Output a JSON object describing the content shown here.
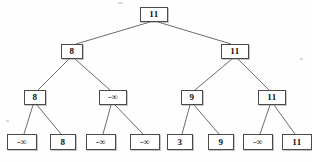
{
  "diagram": {
    "type": "binary-tree",
    "title": "",
    "depth": 4,
    "node_count": 15,
    "colors": {
      "background": "#fefefe",
      "node_fill": "#ffffff",
      "node_border": "#4a4a4a",
      "edge": "#5a5a5a",
      "text": "#111111"
    },
    "nodes": [
      {
        "id": "n1",
        "level": 1,
        "label": "11",
        "x": 154,
        "y": 14
      },
      {
        "id": "n2",
        "level": 2,
        "label": "8",
        "x": 72,
        "y": 51
      },
      {
        "id": "n3",
        "level": 2,
        "label": "11",
        "x": 235,
        "y": 51
      },
      {
        "id": "n4",
        "level": 3,
        "label": "8",
        "x": 35,
        "y": 97
      },
      {
        "id": "n5",
        "level": 3,
        "label": "-∞",
        "x": 113,
        "y": 97
      },
      {
        "id": "n6",
        "level": 3,
        "label": "9",
        "x": 192,
        "y": 97
      },
      {
        "id": "n7",
        "level": 3,
        "label": "11",
        "x": 272,
        "y": 97
      },
      {
        "id": "n8",
        "level": 4,
        "label": "-∞",
        "x": 22,
        "y": 142
      },
      {
        "id": "n9",
        "level": 4,
        "label": "8",
        "x": 63,
        "y": 142
      },
      {
        "id": "n10",
        "level": 4,
        "label": "-∞",
        "x": 101,
        "y": 142
      },
      {
        "id": "n11",
        "level": 4,
        "label": "-∞",
        "x": 145,
        "y": 142
      },
      {
        "id": "n12",
        "level": 4,
        "label": "3",
        "x": 180,
        "y": 142
      },
      {
        "id": "n13",
        "level": 4,
        "label": "9",
        "x": 221,
        "y": 142
      },
      {
        "id": "n14",
        "level": 4,
        "label": "-∞",
        "x": 258,
        "y": 142
      },
      {
        "id": "n15",
        "level": 4,
        "label": "11",
        "x": 297,
        "y": 142
      }
    ],
    "edges": [
      {
        "from": "n1",
        "to": "n2",
        "x1": 150,
        "y1": 22,
        "x2": 76,
        "y2": 44
      },
      {
        "from": "n1",
        "to": "n3",
        "x1": 158,
        "y1": 22,
        "x2": 231,
        "y2": 44
      },
      {
        "from": "n2",
        "to": "n4",
        "x1": 69,
        "y1": 59,
        "x2": 38,
        "y2": 90
      },
      {
        "from": "n2",
        "to": "n5",
        "x1": 75,
        "y1": 59,
        "x2": 110,
        "y2": 90
      },
      {
        "from": "n3",
        "to": "n6",
        "x1": 232,
        "y1": 59,
        "x2": 195,
        "y2": 90
      },
      {
        "from": "n3",
        "to": "n7",
        "x1": 238,
        "y1": 59,
        "x2": 269,
        "y2": 90
      },
      {
        "from": "n4",
        "to": "n8",
        "x1": 33,
        "y1": 105,
        "x2": 24,
        "y2": 134
      },
      {
        "from": "n4",
        "to": "n9",
        "x1": 37,
        "y1": 105,
        "x2": 61,
        "y2": 134
      },
      {
        "from": "n5",
        "to": "n10",
        "x1": 111,
        "y1": 105,
        "x2": 103,
        "y2": 134
      },
      {
        "from": "n5",
        "to": "n11",
        "x1": 115,
        "y1": 105,
        "x2": 143,
        "y2": 134
      },
      {
        "from": "n6",
        "to": "n12",
        "x1": 190,
        "y1": 105,
        "x2": 182,
        "y2": 134
      },
      {
        "from": "n6",
        "to": "n13",
        "x1": 194,
        "y1": 105,
        "x2": 219,
        "y2": 134
      },
      {
        "from": "n7",
        "to": "n14",
        "x1": 270,
        "y1": 105,
        "x2": 260,
        "y2": 134
      },
      {
        "from": "n7",
        "to": "n15",
        "x1": 274,
        "y1": 105,
        "x2": 295,
        "y2": 134
      }
    ]
  }
}
